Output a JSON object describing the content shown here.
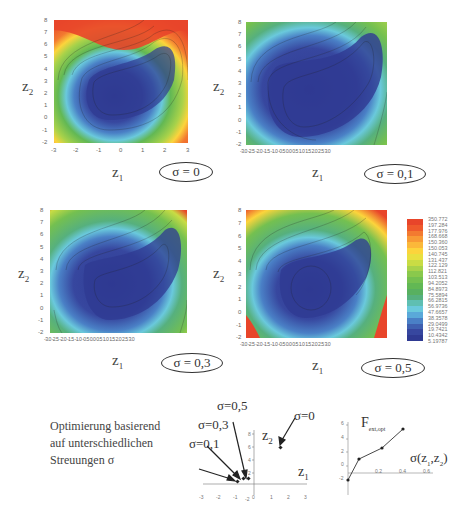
{
  "panels": [
    {
      "id": "p0",
      "sigma_label": "σ = 0",
      "xlabel": "z",
      "xlabel_sub": "1",
      "ylabel": "z",
      "ylabel_sub": "2",
      "xticks": [
        "-3",
        "-2",
        "-1",
        "0",
        "1",
        "2",
        "3"
      ],
      "yticks": [
        "8",
        "7",
        "6",
        "5",
        "4",
        "3",
        "2",
        "1",
        "0",
        "-1",
        "-2"
      ]
    },
    {
      "id": "p1",
      "sigma_label": "σ = 0,1",
      "xlabel": "z",
      "xlabel_sub": "1",
      "ylabel": "z",
      "ylabel_sub": "2",
      "xticks_text": "-3.0 -2.5 -2.0 -1.5 -1.0 -0.5 0.0 0.5 1.0 1.5 2.0 2.5 3.0",
      "yticks": [
        "8",
        "7",
        "6",
        "5",
        "4",
        "3",
        "2",
        "1",
        "0",
        "-1",
        "-2"
      ]
    },
    {
      "id": "p3",
      "sigma_label": "σ = 0,3",
      "xlabel": "z",
      "xlabel_sub": "1",
      "ylabel": "z",
      "ylabel_sub": "2",
      "xticks_text": "-3.0 -2.5 -2.0 -1.5 -1.0 -0.5 0.0 0.5 1.0 1.5 2.0 2.5 3.0",
      "yticks": [
        "8",
        "7",
        "6",
        "5",
        "4",
        "3",
        "2",
        "1",
        "0",
        "-1",
        "-2"
      ]
    },
    {
      "id": "p5",
      "sigma_label": "σ = 0,5",
      "xlabel": "z",
      "xlabel_sub": "1",
      "ylabel": "z",
      "ylabel_sub": "2",
      "xticks_text": "-3.0 -2.5 -2.0 -1.5 -1.0 -0.5 0.0 0.5 1.0 1.5 2.0 2.5 3.0",
      "yticks": [
        "8",
        "7",
        "6",
        "5",
        "4",
        "3",
        "2",
        "1",
        "0",
        "-1",
        "-2"
      ]
    }
  ],
  "colorbar": {
    "labels": [
      "350.772",
      "197.284",
      "177.976",
      "168.668",
      "150.360",
      "150.053",
      "140.745",
      "131.437",
      "122.129",
      "112.821",
      "103.513",
      "94.2052",
      "84.8973",
      "75.5894",
      "66.2815",
      "56.9736",
      "47.6657",
      "38.3578",
      "29.0499",
      "19.7421",
      "10.4342",
      "5.19787"
    ],
    "colors": [
      "#e8452a",
      "#ef5a2c",
      "#f37a30",
      "#f89a35",
      "#fbb83a",
      "#fcd43c",
      "#e9e040",
      "#c9dc44",
      "#a8d24a",
      "#8ac94c",
      "#74c050",
      "#62b854",
      "#58b060",
      "#56b07e",
      "#5fbfb2",
      "#6ac9dc",
      "#5aa9d9",
      "#4a80c6",
      "#3f60b0",
      "#37479f",
      "#2f3a92"
    ]
  },
  "caption": {
    "lines": [
      "Optimierung basierend",
      "auf unterschiedlichen",
      "Streuungen σ"
    ]
  },
  "scatter": {
    "ylabel": "z",
    "ylabel_sub": "2",
    "xlabel": "z",
    "xlabel_sub": "1",
    "xticks": [
      "-3",
      "-2",
      "-1",
      "0",
      "1",
      "2",
      "3"
    ],
    "yticks": [
      "8",
      "6",
      "4",
      "2",
      "-2"
    ],
    "annotations": [
      "σ=0,5",
      "σ=0,3",
      "σ=0,1",
      "σ=0"
    ]
  },
  "chart_data": [
    {
      "type": "scatter",
      "title": "Optimum location per σ",
      "xlabel": "z1",
      "ylabel": "z2",
      "xlim": [
        -3,
        3
      ],
      "ylim": [
        -2,
        8
      ],
      "series": [
        {
          "name": "optima",
          "points": [
            {
              "label": "σ=0",
              "x": 2.0,
              "y": 4.2
            },
            {
              "label": "σ=0,1",
              "x": -0.9,
              "y": 0.9
            },
            {
              "label": "σ=0,3",
              "x": -0.5,
              "y": 1.1
            },
            {
              "label": "σ=0,5",
              "x": -0.3,
              "y": 1.1
            }
          ]
        }
      ]
    },
    {
      "type": "line",
      "title": "F ext,opt vs σ",
      "xlabel": "σ(z1,z2)",
      "ylabel": "F ext,opt",
      "x": [
        0,
        0.1,
        0.3,
        0.5
      ],
      "series": [
        {
          "name": "F_ext,opt",
          "values": [
            -1,
            1,
            2.6,
            5.1
          ]
        }
      ],
      "xticks": [
        "0.2",
        "0.4",
        "0.6"
      ],
      "yticks": [
        "6",
        "4",
        "2",
        "0",
        "-2"
      ],
      "xlim": [
        0,
        0.6
      ],
      "ylim": [
        -2,
        6
      ]
    },
    {
      "type": "heatmap",
      "title": "Contour of objective for σ = 0, 0,1, 0,3, 0,5",
      "xlabel": "z1",
      "ylabel": "z2",
      "xlim": [
        -3,
        3
      ],
      "ylim": [
        -2,
        8
      ],
      "colorbar_range": [
        5.19787,
        350.772
      ]
    }
  ],
  "fext": {
    "ylabel": "F",
    "ylabel_sub": "ext,opt",
    "xlabel": "σ(z",
    "xlabel_mid": "1",
    "xlabel_sep": ",z",
    "xlabel_sub2": "2",
    "xlabel_end": ")",
    "xticks": [
      "0.2",
      "0.4",
      "0.6"
    ],
    "yticks": [
      "6",
      "4",
      "2",
      "0",
      "-2"
    ]
  }
}
